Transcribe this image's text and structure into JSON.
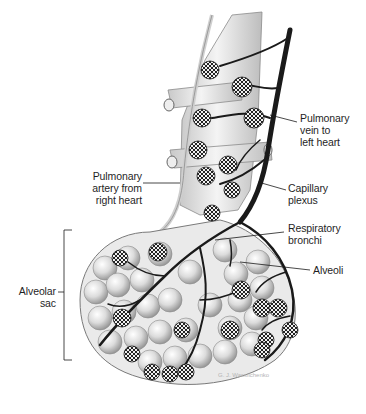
{
  "diagram": {
    "labels": {
      "pulmonary_vein": [
        "Pulmonary",
        "vein to",
        "left heart"
      ],
      "pulmonary_artery": [
        "Pulmonary",
        "artery from",
        "right heart"
      ],
      "capillary_plexus": [
        "Capillary",
        "plexus"
      ],
      "respiratory_bronchi": [
        "Respiratory",
        "bronchi"
      ],
      "alveoli": [
        "Alveoli"
      ],
      "alveolar_sac": [
        "Alveolar",
        "sac"
      ]
    },
    "signature": "G. J. Wassilchenko",
    "colors": {
      "background": "#ffffff",
      "vessel_dark": "#1a1a1a",
      "tissue_light": "#e6e6e6",
      "tissue_shade": "#b8b8b8",
      "label_text": "#1f1f1f"
    }
  }
}
